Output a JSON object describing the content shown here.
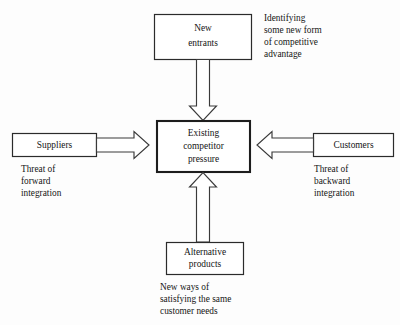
{
  "diagram": {
    "background_color": "#fdfdfd",
    "line_color": "#2b2b2b",
    "text_color": "#151515",
    "center": {
      "line1": "Existing",
      "line2": "competitor",
      "line3": "pressure"
    },
    "top": {
      "line1": "New",
      "line2": "entrants",
      "caption": {
        "line1": "Identifying",
        "line2": "some new form",
        "line3": "of competitive",
        "line4": "advantage"
      }
    },
    "left": {
      "line1": "Suppliers",
      "caption": {
        "line1": "Threat of",
        "line2": "forward",
        "line3": "integration"
      }
    },
    "right": {
      "line1": "Customers",
      "caption": {
        "line1": "Threat of",
        "line2": "backward",
        "line3": "integration"
      }
    },
    "bottom": {
      "line1": "Alternative",
      "line2": "products",
      "caption": {
        "line1": "New ways of",
        "line2": "satisfying the same",
        "line3": "customer needs"
      }
    },
    "arrows": {
      "top_to_center": "arrow-down",
      "left_to_center": "arrow-right",
      "right_to_center": "arrow-left",
      "bottom_to_center": "arrow-up"
    }
  }
}
